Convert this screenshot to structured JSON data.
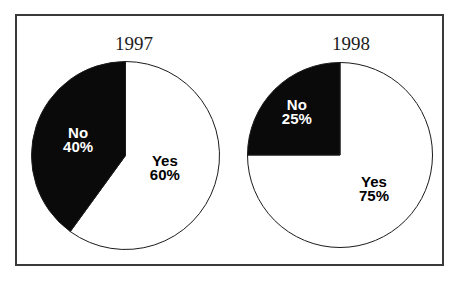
{
  "figure": {
    "background": "#ffffff",
    "border_color": "#3a3a3a",
    "slice_black": "#0a0a0a",
    "slice_white": "#ffffff"
  },
  "chart_data": [
    {
      "type": "pie",
      "title": "1997",
      "start_angle_deg": 0,
      "direction": "clockwise",
      "slices": [
        {
          "label": "Yes",
          "value": 60,
          "pct_text": "60%",
          "color": "#ffffff",
          "label_color": "#000000"
        },
        {
          "label": "No",
          "value": 40,
          "pct_text": "40%",
          "color": "#0a0a0a",
          "label_color": "#ffffff"
        }
      ]
    },
    {
      "type": "pie",
      "title": "1998",
      "start_angle_deg": 0,
      "direction": "clockwise",
      "slices": [
        {
          "label": "Yes",
          "value": 75,
          "pct_text": "75%",
          "color": "#ffffff",
          "label_color": "#000000"
        },
        {
          "label": "No",
          "value": 25,
          "pct_text": "25%",
          "color": "#0a0a0a",
          "label_color": "#ffffff"
        }
      ]
    }
  ]
}
